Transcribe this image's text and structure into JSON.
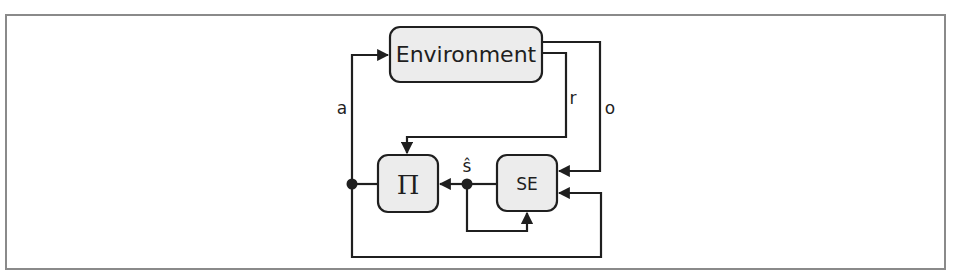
{
  "diagram": {
    "type": "block-diagram",
    "title": "",
    "colors": {
      "box_fill": "#ececec",
      "stroke": "#1f1f1f",
      "frame": "#8a8a8a",
      "background": "#ffffff"
    },
    "nodes": [
      {
        "id": "environment",
        "label": "Environment"
      },
      {
        "id": "policy",
        "label": "Π"
      },
      {
        "id": "state_estimator",
        "label": "SE"
      }
    ],
    "edge_labels": {
      "action": "a",
      "reward": "r",
      "observation": "o",
      "state_estimate": "ŝ"
    },
    "edges": [
      {
        "from": "policy",
        "to": "environment",
        "label": "a"
      },
      {
        "from": "environment",
        "to": "policy",
        "label": "r"
      },
      {
        "from": "environment",
        "to": "state_estimator",
        "label": "o"
      },
      {
        "from": "state_estimator",
        "to": "policy",
        "label": "ŝ"
      },
      {
        "from": "state_estimator",
        "to": "state_estimator",
        "label": "ŝ (feedback)"
      },
      {
        "from": "policy",
        "to": "state_estimator",
        "label": "a (feedback)"
      }
    ]
  }
}
